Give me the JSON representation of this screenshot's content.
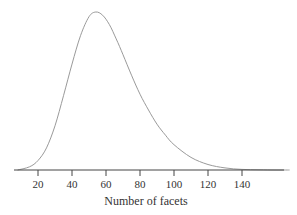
{
  "chart_data": {
    "type": "line",
    "title": "",
    "xlabel": "Number of facets",
    "ylabel": "",
    "x_ticks": [
      20,
      40,
      60,
      80,
      100,
      120,
      140
    ],
    "xlim": [
      6,
      165
    ],
    "grid": false,
    "legend": null,
    "series": [
      {
        "name": "density",
        "x": [
          8,
          15,
          20,
          25,
          30,
          35,
          40,
          45,
          50,
          54,
          58,
          62,
          66,
          70,
          75,
          80,
          85,
          90,
          95,
          100,
          110,
          120,
          130,
          140,
          150,
          160
        ],
        "y": [
          0.0,
          0.02,
          0.06,
          0.14,
          0.28,
          0.47,
          0.67,
          0.85,
          0.97,
          1.0,
          0.98,
          0.92,
          0.83,
          0.73,
          0.6,
          0.48,
          0.38,
          0.29,
          0.22,
          0.16,
          0.08,
          0.035,
          0.013,
          0.004,
          0.001,
          0.0
        ]
      }
    ]
  },
  "axis": {
    "tick_labels": [
      "20",
      "40",
      "60",
      "80",
      "100",
      "120",
      "140"
    ],
    "xlabel": "Number of facets"
  }
}
